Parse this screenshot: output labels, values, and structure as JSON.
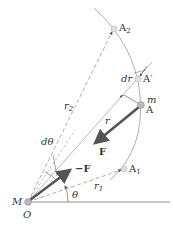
{
  "diagram": {
    "points": {
      "O": {
        "label": "O",
        "x": 28,
        "y": 202
      },
      "M": {
        "label": "M"
      },
      "A": {
        "label": "A",
        "x": 141,
        "y": 105
      },
      "A_prime": {
        "label": "A′",
        "x": 138,
        "y": 79
      },
      "A1": {
        "label": "A",
        "sub": "1",
        "x": 124,
        "y": 169
      },
      "A2": {
        "label": "A",
        "sub": "2",
        "x": 114,
        "y": 29
      },
      "m": {
        "label": "m"
      }
    },
    "labels": {
      "r": "r",
      "r1": "r",
      "r1_sub": "1",
      "r2": "r",
      "r2_sub": "2",
      "dr": "dr",
      "dtheta": "dθ",
      "theta": "θ",
      "F": "F",
      "negF": "−F"
    },
    "colors": {
      "line": "#888888",
      "arrow": "#555555",
      "text": "#333333",
      "point": "#cccccc"
    }
  }
}
